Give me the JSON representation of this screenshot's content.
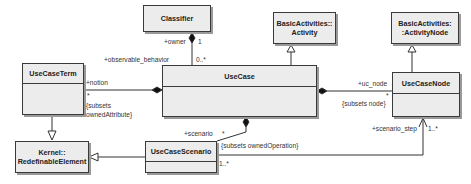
{
  "classes": {
    "classifier": {
      "name": "Classifier"
    },
    "activity": {
      "line1": "BasicActivities::",
      "line2": "Activity"
    },
    "activity_node": {
      "line1": "BasicActivities:",
      "line2": ":ActivityNode"
    },
    "use_case_term": {
      "name": "UseCaseTerm"
    },
    "use_case": {
      "name": "UseCase"
    },
    "use_case_node": {
      "name": "UseCaseNode"
    },
    "redefinable_element": {
      "line1": "Kernel::",
      "line2": "RedefinableElement"
    },
    "use_case_scenario": {
      "name": "UseCaseScenario"
    }
  },
  "labels": {
    "owner": "+owner",
    "owner_mult": "1",
    "observable_behavior": "+observable_behavior",
    "observable_mult": "0..*",
    "notion": "+notion",
    "notion_mult": "*",
    "subsets_owned_attribute_1": "{subsets",
    "subsets_owned_attribute_2": "ownedAttribute}",
    "uc_node": "+uc_node",
    "uc_node_mult": "*",
    "subsets_node": "{subsets node}",
    "scenario": "+scenario",
    "scenario_mult": "*",
    "subsets_owned_operation": "{subsets ownedOperation}",
    "scenario_step": "+scenario_step",
    "scenario_step_mult": "1..*",
    "scenario_src_mult": "1..*"
  }
}
